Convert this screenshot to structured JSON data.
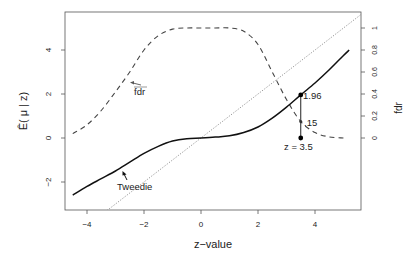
{
  "chart_data": {
    "type": "line",
    "title": "",
    "xlabel": "z−value",
    "ylabel": "Ê( μ | z)",
    "ylabel_right": "fdr",
    "xlim": [
      -4.7,
      5.6
    ],
    "ylim": [
      -3.3,
      5.7
    ],
    "ylim_right": [
      -0.3,
      1.3
    ],
    "xticks": [
      "−4",
      "−2",
      "0",
      "2",
      "4"
    ],
    "xtick_values": [
      -4,
      -2,
      0,
      2,
      4
    ],
    "yticks": [
      "−2",
      "0",
      "2",
      "4"
    ],
    "ytick_values": [
      -2,
      0,
      2,
      4
    ],
    "yticks_right": [
      "0",
      "0.2",
      "0.4",
      "0.6",
      "0.8",
      "1"
    ],
    "ytick_right_values": [
      0,
      0.2,
      0.4,
      0.6,
      0.8,
      1
    ],
    "grid": false,
    "series": [
      {
        "name": "Tweedie",
        "style": "solid",
        "axis": "left",
        "x": [
          -4.5,
          -4,
          -3.5,
          -3,
          -2.5,
          -2,
          -1.5,
          -1,
          -0.5,
          0,
          0.5,
          1,
          1.5,
          2,
          2.5,
          3,
          3.5,
          4,
          4.5,
          5,
          5.2
        ],
        "y": [
          -2.6,
          -2.2,
          -1.85,
          -1.5,
          -1.1,
          -0.7,
          -0.38,
          -0.14,
          -0.03,
          0,
          0.04,
          0.1,
          0.25,
          0.5,
          0.9,
          1.4,
          1.96,
          2.5,
          3.1,
          3.75,
          4.0
        ]
      },
      {
        "name": "fdr",
        "style": "dashed",
        "axis": "right",
        "x": [
          -4.5,
          -4,
          -3.5,
          -3,
          -2.5,
          -2,
          -1.5,
          -1,
          -0.5,
          0,
          0.5,
          1,
          1.5,
          2,
          2.5,
          3,
          3.5,
          4,
          4.5,
          5
        ],
        "y": [
          0.04,
          0.12,
          0.25,
          0.42,
          0.6,
          0.8,
          0.93,
          0.99,
          1.0,
          1.0,
          1.0,
          1.0,
          0.97,
          0.85,
          0.6,
          0.35,
          0.15,
          0.05,
          0.01,
          0.0
        ]
      },
      {
        "name": "identity (y = z)",
        "style": "dotted",
        "axis": "left",
        "x": [
          -3.3,
          5.6
        ],
        "y": [
          -3.3,
          5.6
        ]
      }
    ],
    "annotations": [
      {
        "text": "Tweedie",
        "x": -2.5,
        "y": -1.9,
        "arrow_to": [
          -2.75,
          -1.5
        ]
      },
      {
        "text": "fdr",
        "x": -2.3,
        "y": 0.55,
        "arrow_to": [
          -2.75,
          0.52
        ]
      },
      {
        "text": "1.96",
        "x": 3.5,
        "y": 1.96,
        "marker": "point"
      },
      {
        "text": ".15",
        "x": 3.5,
        "y": 0.15,
        "axis": "right",
        "marker": "small-point"
      },
      {
        "text": "z = 3.5",
        "x": 3.5,
        "y": 0,
        "marker": "point"
      }
    ]
  },
  "labels": {
    "xlabel": "z−value",
    "ylabel": "Ê( μ | z)",
    "ylabel_right": "fdr",
    "tweedie": "Tweedie",
    "fdr": "fdr",
    "point_value": "1.96",
    "fdr_value": ".15",
    "z_point": "z = 3.5"
  }
}
